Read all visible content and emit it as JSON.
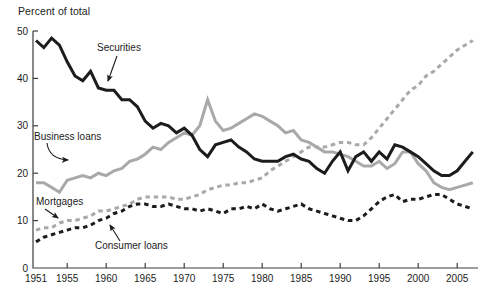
{
  "chart_data": {
    "type": "line",
    "title": "Percent of total",
    "ylim": [
      0,
      50
    ],
    "y_ticks": [
      0,
      10,
      20,
      30,
      40,
      50
    ],
    "x_axis_labels": [
      1951,
      1955,
      1960,
      1965,
      1970,
      1975,
      1980,
      1985,
      1990,
      1995,
      2000,
      2005
    ],
    "grid": false,
    "legend_position": "direct-labels-with-arrows",
    "years": [
      1951,
      1952,
      1953,
      1954,
      1955,
      1956,
      1957,
      1958,
      1959,
      1960,
      1961,
      1962,
      1963,
      1964,
      1965,
      1966,
      1967,
      1968,
      1969,
      1970,
      1971,
      1972,
      1973,
      1974,
      1975,
      1976,
      1977,
      1978,
      1979,
      1980,
      1981,
      1982,
      1983,
      1984,
      1985,
      1986,
      1987,
      1988,
      1989,
      1990,
      1991,
      1992,
      1993,
      1994,
      1995,
      1996,
      1997,
      1998,
      1999,
      2000,
      2001,
      2002,
      2003,
      2004,
      2005,
      2006,
      2007
    ],
    "series": [
      {
        "name": "Securities",
        "color": "#1c1c1c",
        "style": "solid",
        "values": [
          48,
          46.5,
          48.5,
          47,
          43.5,
          40.5,
          39.5,
          41.5,
          38,
          37.5,
          37.5,
          35.5,
          35.5,
          34,
          31,
          29.5,
          30.5,
          30,
          28.5,
          29.5,
          28,
          25,
          23.5,
          26,
          26.5,
          27,
          25.5,
          24.5,
          23,
          22.5,
          22.5,
          22.5,
          23.5,
          24,
          23,
          22.5,
          21,
          20,
          22.5,
          24.5,
          20.5,
          23.5,
          24.5,
          22.5,
          24.5,
          23,
          26,
          25.5,
          24.5,
          23.5,
          22,
          20.5,
          19.5,
          19.5,
          20.5,
          22.5,
          24.5
        ]
      },
      {
        "name": "Business loans",
        "color": "#a9a9a9",
        "style": "solid",
        "values": [
          18,
          18,
          17,
          16,
          18.5,
          19,
          19.5,
          19,
          20,
          19.5,
          20.5,
          21,
          22.5,
          23,
          24,
          25.5,
          25,
          26.5,
          27.5,
          28.5,
          28,
          30,
          35.5,
          31,
          29,
          29.5,
          30.5,
          31.5,
          32.5,
          32,
          31,
          30,
          28.5,
          29,
          27,
          26.5,
          25.5,
          24.5,
          24.5,
          24,
          23.5,
          22.5,
          21.5,
          21.5,
          22.5,
          21,
          22,
          24.5,
          24.5,
          22,
          20.5,
          18,
          17,
          16.5,
          17,
          17.5,
          18
        ]
      },
      {
        "name": "Mortgages",
        "color": "#a9a9a9",
        "style": "dashed",
        "values": [
          8,
          8.5,
          8.5,
          9.5,
          10,
          10,
          10.5,
          11,
          12,
          12,
          12.5,
          13,
          13.5,
          14.5,
          15,
          15,
          15,
          15,
          14.5,
          14.5,
          15,
          15.5,
          16.5,
          17,
          17.5,
          17.5,
          18,
          18,
          18.5,
          19,
          20.5,
          21.5,
          22.5,
          23.5,
          24.5,
          25.5,
          25.5,
          25.5,
          26,
          26.5,
          26.5,
          26,
          26,
          27.5,
          29.5,
          31.5,
          33.5,
          35.5,
          37.5,
          38.5,
          40.5,
          41.5,
          43,
          44.5,
          46,
          47,
          48
        ]
      },
      {
        "name": "Consumer loans",
        "color": "#1c1c1c",
        "style": "dashed",
        "values": [
          5.5,
          6.5,
          7,
          7.5,
          8,
          8.5,
          8.5,
          9,
          10,
          10.5,
          11.5,
          12,
          13,
          13.5,
          13.5,
          13,
          13,
          13.5,
          13,
          12.5,
          12.5,
          12,
          12.5,
          12,
          11.5,
          12.5,
          12.5,
          13,
          12.5,
          13.5,
          12.5,
          12,
          12.5,
          13,
          13.5,
          12.5,
          12,
          11.5,
          11,
          10.5,
          10,
          10,
          11,
          12.5,
          14,
          15,
          15.5,
          14,
          14.5,
          14.5,
          15,
          15.5,
          15.5,
          14.5,
          13.5,
          13,
          12.5
        ]
      }
    ],
    "annotations": [
      {
        "label": "Securities",
        "text_x": 97,
        "text_y": 51,
        "arrow_from": [
          117,
          56
        ],
        "arrow_to": [
          108,
          81
        ],
        "curved": false
      },
      {
        "label": "Business loans",
        "text_x": 34,
        "text_y": 140,
        "arrow_from": [
          47,
          143
        ],
        "arrow_to": [
          68,
          160
        ],
        "curved": true
      },
      {
        "label": "Mortgages",
        "text_x": 36,
        "text_y": 205,
        "arrow_from": [
          45,
          209
        ],
        "arrow_to": [
          58,
          218
        ],
        "curved": false
      },
      {
        "label": "Consumer loans",
        "text_x": 95,
        "text_y": 249,
        "arrow_from": [
          120,
          241
        ],
        "arrow_to": [
          110,
          225
        ],
        "curved": false
      }
    ]
  },
  "layout": {
    "plot": {
      "x_axis_y": 268,
      "y_axis_x": 33,
      "y_top": 31,
      "x_right": 478,
      "x_year0": 36,
      "px_per_year": 7.8,
      "px_per_unit": 4.74
    },
    "axis_color": "#3c3c3c",
    "text_color": "#1c1c1c",
    "tick_len": 5,
    "font_size_ticks": 10,
    "font_size_annotations": 10
  }
}
